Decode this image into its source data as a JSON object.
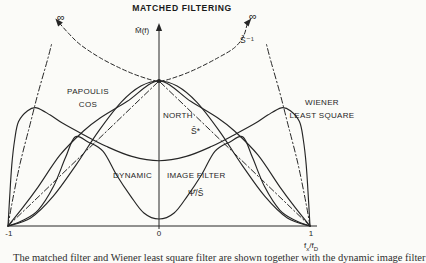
{
  "title": "MATCHED FILTERING",
  "axis": {
    "y_label": "M̂(f)",
    "tick_minus1": "-1",
    "tick_zero": "0",
    "tick_one": "1",
    "fx_base": "f",
    "fx_sub": "x",
    "fd_base": "/f",
    "fd_sub": "D"
  },
  "annotations": {
    "infinity_left": "∞",
    "infinity_right": "∞",
    "s_inverse": "Ŝ⁻¹",
    "papoulis_line1": "PAPOULIS",
    "papoulis_line2": "COS",
    "north": "NORTH",
    "s_star": "Ŝ*",
    "wiener_line1": "WIENER",
    "wiener_line2": "LEAST SQUARE",
    "dynamic_word": "DYNAMIC",
    "image_filter_word": "IMAGE FILTER",
    "psi_over_s": "Ψ̂/Ŝ"
  },
  "caption_fragment": "The matched filter and Wiener least square filter are shown together with the dynamic image filter",
  "colors": {
    "ink": "#262626",
    "background": "#fbfbf8"
  },
  "chart_data": {
    "type": "line",
    "title": "MATCHED FILTERING",
    "xlabel": "f_x/f_D",
    "ylabel": "M̂(f)",
    "x_range": [
      -1,
      1
    ],
    "x_ticks": [
      -1,
      0,
      1
    ],
    "grid": false,
    "curves": [
      {
        "name": "s-inverse",
        "label": "Ŝ⁻¹",
        "style": "dashed",
        "points": [
          [
            -0.66,
            1.4
          ],
          [
            -0.6,
            1.33
          ],
          [
            -0.52,
            1.25
          ],
          [
            -0.39,
            1.16
          ],
          [
            -0.25,
            1.085
          ],
          [
            -0.12,
            1.03
          ],
          [
            0,
            1.0
          ],
          [
            0.12,
            1.03
          ],
          [
            0.25,
            1.085
          ],
          [
            0.39,
            1.16
          ],
          [
            0.5,
            1.23
          ],
          [
            0.56,
            1.31
          ],
          [
            0.585,
            1.4
          ]
        ]
      },
      {
        "name": "inverse-asymptote-left",
        "label": "",
        "style": "dash-dot",
        "points": [
          [
            -1,
            0
          ],
          [
            -0.973,
            0.16
          ],
          [
            -0.92,
            0.43
          ],
          [
            -0.854,
            0.7
          ],
          [
            -0.8,
            0.92
          ],
          [
            -0.74,
            1.14
          ],
          [
            -0.71,
            1.26
          ]
        ]
      },
      {
        "name": "inverse-asymptote-right",
        "label": "",
        "style": "dash-dot",
        "points": [
          [
            1,
            0
          ],
          [
            0.973,
            0.16
          ],
          [
            0.92,
            0.43
          ],
          [
            0.854,
            0.7
          ],
          [
            0.8,
            0.92
          ],
          [
            0.74,
            1.14
          ],
          [
            0.71,
            1.26
          ]
        ]
      },
      {
        "name": "triangle-left",
        "label": "",
        "style": "dash-dot",
        "points": [
          [
            -1,
            0
          ],
          [
            0,
            1
          ]
        ]
      },
      {
        "name": "triangle-right",
        "label": "",
        "style": "dash-dot",
        "points": [
          [
            1,
            0
          ],
          [
            0,
            1
          ]
        ]
      },
      {
        "name": "papoulis-cos",
        "label": "PAPOULIS COS",
        "style": "solid",
        "points": [
          [
            -1,
            0
          ],
          [
            -0.9,
            0.13
          ],
          [
            -0.8,
            0.27
          ],
          [
            -0.655,
            0.49
          ],
          [
            -0.5,
            0.655
          ],
          [
            -0.39,
            0.745
          ],
          [
            -0.21,
            0.86
          ],
          [
            0,
            1
          ],
          [
            0.21,
            0.86
          ],
          [
            0.39,
            0.745
          ],
          [
            0.5,
            0.655
          ],
          [
            0.655,
            0.49
          ],
          [
            0.8,
            0.27
          ],
          [
            0.9,
            0.13
          ],
          [
            1,
            0
          ]
        ]
      },
      {
        "name": "north",
        "label": "NORTH Ŝ*",
        "style": "solid",
        "points": [
          [
            -1,
            0
          ],
          [
            -0.85,
            0.055
          ],
          [
            -0.7,
            0.206
          ],
          [
            -0.55,
            0.42
          ],
          [
            -0.4,
            0.654
          ],
          [
            -0.25,
            0.854
          ],
          [
            -0.12,
            0.965
          ],
          [
            0,
            1
          ],
          [
            0.12,
            0.965
          ],
          [
            0.25,
            0.854
          ],
          [
            0.4,
            0.654
          ],
          [
            0.55,
            0.42
          ],
          [
            0.7,
            0.206
          ],
          [
            0.85,
            0.055
          ],
          [
            1,
            0
          ]
        ]
      },
      {
        "name": "wiener-least-square",
        "label": "WIENER LEAST SQUARE",
        "style": "solid",
        "points": [
          [
            -1,
            0
          ],
          [
            -0.99,
            0.18
          ],
          [
            -0.975,
            0.42
          ],
          [
            -0.955,
            0.6
          ],
          [
            -0.93,
            0.72
          ],
          [
            -0.87,
            0.795
          ],
          [
            -0.81,
            0.815
          ],
          [
            -0.72,
            0.765
          ],
          [
            -0.64,
            0.71
          ],
          [
            -0.5,
            0.63
          ],
          [
            -0.35,
            0.55
          ],
          [
            -0.18,
            0.48
          ],
          [
            0,
            0.45
          ],
          [
            0.18,
            0.48
          ],
          [
            0.35,
            0.55
          ],
          [
            0.5,
            0.63
          ],
          [
            0.64,
            0.71
          ],
          [
            0.72,
            0.765
          ],
          [
            0.81,
            0.815
          ],
          [
            0.87,
            0.795
          ],
          [
            0.93,
            0.72
          ],
          [
            0.955,
            0.6
          ],
          [
            0.975,
            0.42
          ],
          [
            0.99,
            0.18
          ],
          [
            1,
            0
          ]
        ]
      },
      {
        "name": "dynamic-image-filter",
        "label": "DYNAMIC IMAGE FILTER Ψ̂/Ŝ",
        "style": "solid",
        "points": [
          [
            -1,
            0
          ],
          [
            -0.9,
            0.04
          ],
          [
            -0.8,
            0.11
          ],
          [
            -0.7,
            0.27
          ],
          [
            -0.62,
            0.47
          ],
          [
            -0.556,
            0.614
          ],
          [
            -0.47,
            0.58
          ],
          [
            -0.37,
            0.515
          ],
          [
            -0.28,
            0.35
          ],
          [
            -0.19,
            0.21
          ],
          [
            -0.1,
            0.09
          ],
          [
            0,
            0.048
          ],
          [
            0.1,
            0.09
          ],
          [
            0.19,
            0.21
          ],
          [
            0.28,
            0.35
          ],
          [
            0.37,
            0.515
          ],
          [
            0.47,
            0.58
          ],
          [
            0.556,
            0.614
          ],
          [
            0.62,
            0.47
          ],
          [
            0.7,
            0.27
          ],
          [
            0.8,
            0.11
          ],
          [
            0.9,
            0.04
          ],
          [
            1,
            0
          ]
        ]
      }
    ],
    "arrows": [
      {
        "name": "y-axis-arrow",
        "f": 0,
        "v": 1.365,
        "angle": 0
      },
      {
        "name": "infinity-arrow-left",
        "f": -0.665,
        "v": 1.405,
        "angle": -40
      },
      {
        "name": "infinity-arrow-right",
        "f": 0.59,
        "v": 1.405,
        "angle": 40
      }
    ],
    "convergence_point": {
      "f": 0,
      "v": 1.0
    }
  }
}
